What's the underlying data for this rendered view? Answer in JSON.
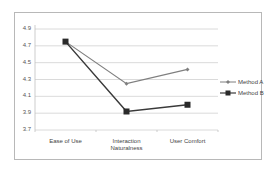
{
  "chart_data": {
    "type": "line",
    "title": "",
    "xlabel": "",
    "ylabel": "",
    "categories": [
      "Ease of Use",
      "Interaction Naturalness",
      "User Comfort"
    ],
    "category_lines": [
      [
        "Ease of Use"
      ],
      [
        "Interaction",
        "Naturalness"
      ],
      [
        "User Comfort"
      ]
    ],
    "series": [
      {
        "name": "Method A",
        "values": [
          4.75,
          4.25,
          4.42
        ],
        "color": "#7f7f7f",
        "marker": "diamond"
      },
      {
        "name": "Method B",
        "values": [
          4.75,
          3.92,
          4.0
        ],
        "color": "#3a3a3a",
        "marker": "square"
      }
    ],
    "ylim": [
      3.7,
      4.9
    ],
    "yticks": [
      "4.9",
      "4.7",
      "4.5",
      "4.3",
      "4.1",
      "3.9",
      "3.7"
    ],
    "grid": true,
    "legend_position": "right"
  }
}
